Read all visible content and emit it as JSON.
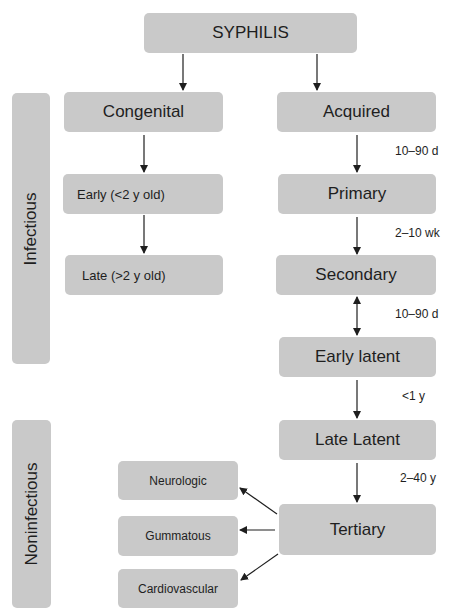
{
  "diagram": {
    "root": "SYPHILIS",
    "categories": {
      "infectious": "Infectious",
      "noninfectious": "Noninfectious"
    },
    "congenital": {
      "label": "Congenital",
      "children": [
        "Early (<2 y old)",
        "Late (>2 y old)"
      ]
    },
    "acquired": {
      "label": "Acquired",
      "stages": [
        "Primary",
        "Secondary",
        "Early latent",
        "Late Latent",
        "Tertiary"
      ],
      "durations": [
        "10–90 d",
        "2–10 wk",
        "10–90 d",
        "<1 y",
        "2–40 y"
      ]
    },
    "tertiary_outcomes": [
      "Neurologic",
      "Gummatous",
      "Cardiovascular"
    ]
  },
  "colors": {
    "box_fill": "#c9c9c9",
    "text": "#1e1e1e",
    "arrow": "#1e1e1e",
    "background": "#ffffff"
  }
}
